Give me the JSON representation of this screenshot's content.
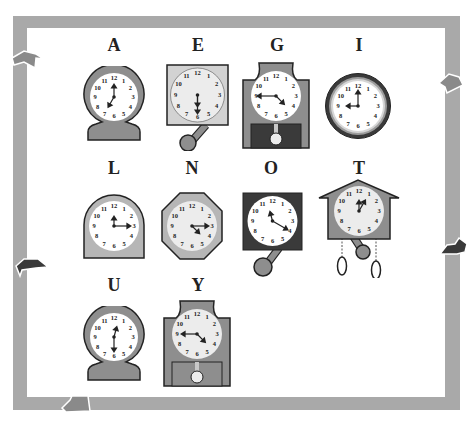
{
  "puzzle": {
    "type": "clock-letter matching",
    "colors": {
      "frame": "#a9a9a9",
      "case_gray": "#8e8e8e",
      "case_light": "#c8c8c8",
      "case_dark": "#3a3a3a",
      "face_white": "#ffffff",
      "face_light": "#ececec",
      "hand": "#222222"
    },
    "clocks": [
      {
        "letter": "A",
        "style": "round-mantel",
        "time": "7:00",
        "hour_pos": 7,
        "minute_pos": 12
      },
      {
        "letter": "E",
        "style": "square-pendulum",
        "time": "6:30",
        "hour_pos": 6,
        "minute_pos": 6
      },
      {
        "letter": "G",
        "style": "grandfather",
        "time": "4:45",
        "hour_pos": 4.5,
        "minute_pos": 9
      },
      {
        "letter": "I",
        "style": "wall-round",
        "time": "9:00",
        "hour_pos": 9,
        "minute_pos": 12
      },
      {
        "letter": "L",
        "style": "arched-mantel",
        "time": "12:15",
        "hour_pos": 12,
        "minute_pos": 3
      },
      {
        "letter": "N",
        "style": "octagon",
        "time": "4:15",
        "hour_pos": 4.5,
        "minute_pos": 3
      },
      {
        "letter": "O",
        "style": "dark-square-pendulum",
        "time": "10:20",
        "hour_pos": 11.5,
        "minute_pos": 4
      },
      {
        "letter": "T",
        "style": "cuckoo",
        "time": "12:05",
        "hour_pos": 12,
        "minute_pos": 1
      },
      {
        "letter": "U",
        "style": "round-mantel",
        "time": "12:30",
        "hour_pos": 12.5,
        "minute_pos": 6
      },
      {
        "letter": "Y",
        "style": "grandfather",
        "time": "4:45",
        "hour_pos": 4.5,
        "minute_pos": 9
      }
    ],
    "dial_numbers": [
      "12",
      "1",
      "2",
      "3",
      "4",
      "5",
      "6",
      "7",
      "8",
      "9",
      "10",
      "11"
    ]
  }
}
